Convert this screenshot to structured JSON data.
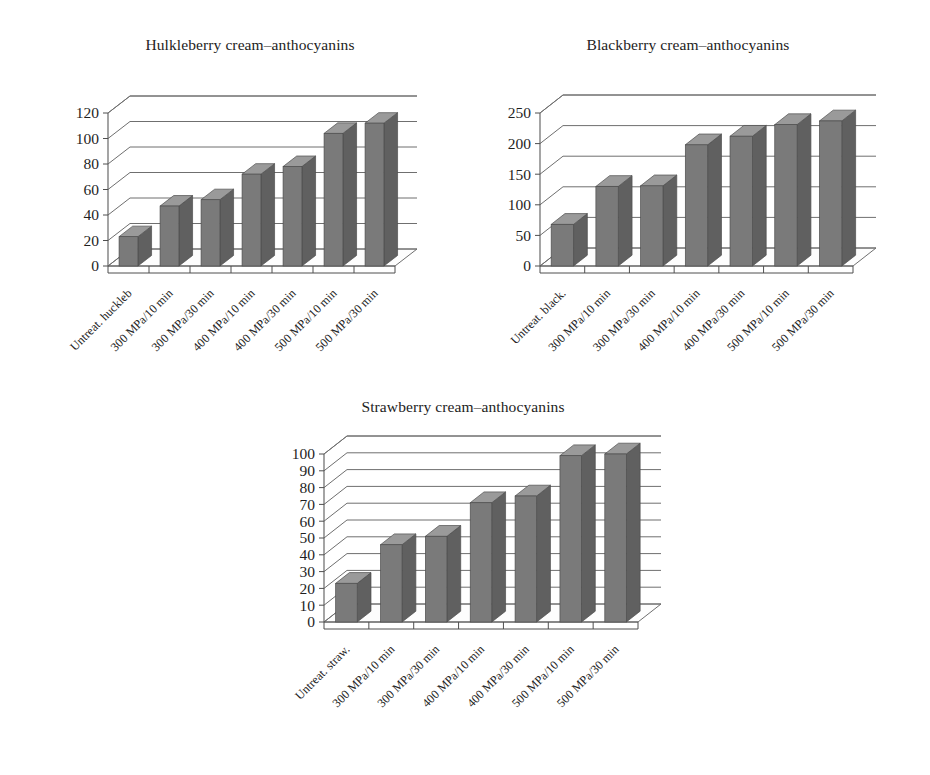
{
  "page": {
    "background": "#ffffff",
    "bar_color": "#7a7a7a",
    "bar_top_color": "#9a9a9a",
    "bar_side_color": "#606060",
    "grid_color": "#6f6f6f",
    "text_color": "#1b1b1b"
  },
  "charts": [
    {
      "id": "huckleberry",
      "title": "Hulkleberry cream–anthocyanins",
      "categories": [
        "Untreat. huckleb",
        "300 MPa/10 min",
        "300 MPa/30 min",
        "400 MPa/10 min",
        "400 MPa/30 min",
        "500 MPa/10 min",
        "500 MPa/30 min"
      ],
      "values": [
        23,
        47,
        52,
        72,
        78,
        104,
        112
      ],
      "yticks": [
        0,
        20,
        40,
        60,
        80,
        100,
        120
      ],
      "ylim": [
        0,
        120
      ]
    },
    {
      "id": "blackberry",
      "title": "Blackberry cream–anthocyanins",
      "categories": [
        "Untreat. black.",
        "300 MPa/10 min",
        "300 MPa/30 min",
        "400 MPa/10 min",
        "400 MPa/30 min",
        "500 MPa/10 min",
        "500 MPa/30 min"
      ],
      "values": [
        68,
        130,
        131,
        198,
        212,
        231,
        237
      ],
      "yticks": [
        0,
        50,
        100,
        150,
        200,
        250
      ],
      "ylim": [
        0,
        250
      ]
    },
    {
      "id": "strawberry",
      "title": "Strawberry cream–anthocyanins",
      "categories": [
        "Untreat. straw.",
        "300 MPa/10 min",
        "300 MPa/30 min",
        "400 MPa/10 min",
        "400 MPa/30 min",
        "500 MPa/10 min",
        "500 MPa/30 min"
      ],
      "values": [
        23,
        46,
        51,
        71,
        75,
        99,
        100
      ],
      "yticks": [
        0,
        10,
        20,
        30,
        40,
        50,
        60,
        70,
        80,
        90,
        100
      ],
      "ylim": [
        0,
        100
      ]
    }
  ],
  "chart_data": [
    {
      "type": "bar",
      "title": "Hulkleberry cream–anthocyanins",
      "xlabel": "",
      "ylabel": "",
      "grid": true,
      "legend": "none",
      "ylim": [
        0,
        120
      ],
      "yticks": [
        0,
        20,
        40,
        60,
        80,
        100,
        120
      ],
      "categories": [
        "Untreat. huckleb",
        "300 MPa/10 min",
        "300 MPa/30 min",
        "400 MPa/10 min",
        "400 MPa/30 min",
        "500 MPa/10 min",
        "500 MPa/30 min"
      ],
      "values": [
        23,
        47,
        52,
        72,
        78,
        104,
        112
      ]
    },
    {
      "type": "bar",
      "title": "Blackberry cream–anthocyanins",
      "xlabel": "",
      "ylabel": "",
      "grid": true,
      "legend": "none",
      "ylim": [
        0,
        250
      ],
      "yticks": [
        0,
        50,
        100,
        150,
        200,
        250
      ],
      "categories": [
        "Untreat. black.",
        "300 MPa/10 min",
        "300 MPa/30 min",
        "400 MPa/10 min",
        "400 MPa/30 min",
        "500 MPa/10 min",
        "500 MPa/30 min"
      ],
      "values": [
        68,
        130,
        131,
        198,
        212,
        231,
        237
      ]
    },
    {
      "type": "bar",
      "title": "Strawberry cream–anthocyanins",
      "xlabel": "",
      "ylabel": "",
      "grid": true,
      "legend": "none",
      "ylim": [
        0,
        100
      ],
      "yticks": [
        0,
        10,
        20,
        30,
        40,
        50,
        60,
        70,
        80,
        90,
        100
      ],
      "categories": [
        "Untreat. straw.",
        "300 MPa/10 min",
        "300 MPa/30 min",
        "400 MPa/10 min",
        "400 MPa/30 min",
        "500 MPa/10 min",
        "500 MPa/30 min"
      ],
      "values": [
        23,
        46,
        51,
        71,
        75,
        99,
        100
      ]
    }
  ]
}
